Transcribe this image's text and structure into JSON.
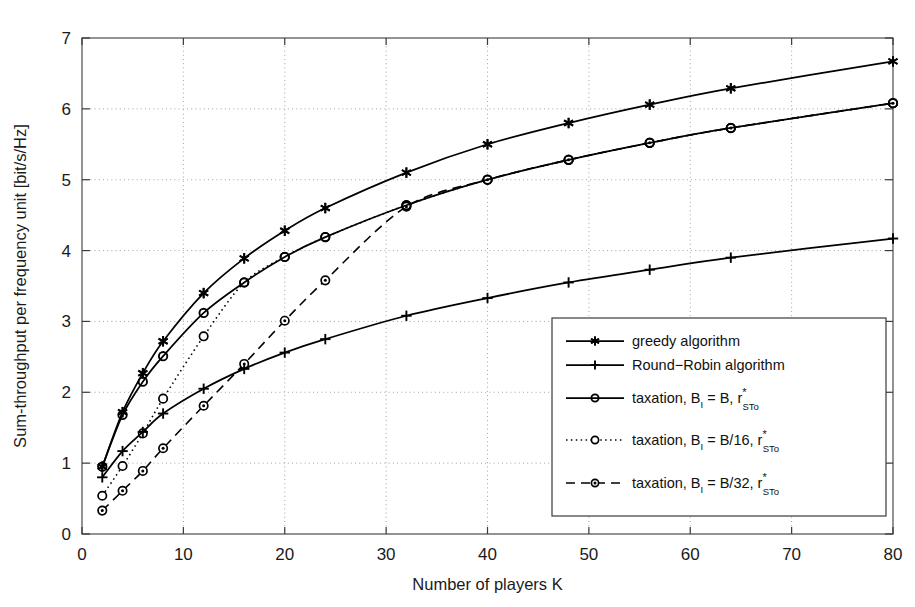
{
  "chart_data": {
    "type": "line",
    "title": "",
    "xlabel": "Number of players K",
    "ylabel": "Sum-throughput per frequency unit [bit/s/Hz]",
    "xlim": [
      0,
      80
    ],
    "ylim": [
      0,
      7
    ],
    "xticks": [
      "0",
      "10",
      "20",
      "30",
      "40",
      "50",
      "60",
      "70",
      "80"
    ],
    "yticks": [
      "0",
      "1",
      "2",
      "3",
      "4",
      "5",
      "6",
      "7"
    ],
    "grid": "dotted",
    "legend_position": "lower-right",
    "series": [
      {
        "name": "greedy algorithm",
        "marker": "asterisk",
        "linestyle": "solid",
        "color": "#000000",
        "x": [
          2,
          4,
          6,
          8,
          12,
          16,
          20,
          24,
          32,
          40,
          48,
          56,
          64,
          80
        ],
        "y": [
          0.95,
          1.72,
          2.27,
          2.72,
          3.4,
          3.89,
          4.28,
          4.6,
          5.1,
          5.5,
          5.8,
          6.06,
          6.29,
          6.67
        ]
      },
      {
        "name": "Round-Robin algorithm",
        "marker": "plus",
        "linestyle": "solid",
        "color": "#000000",
        "x": [
          2,
          4,
          6,
          8,
          12,
          16,
          20,
          24,
          32,
          40,
          48,
          56,
          64,
          80
        ],
        "y": [
          0.8,
          1.17,
          1.44,
          1.7,
          2.05,
          2.33,
          2.56,
          2.75,
          3.08,
          3.33,
          3.55,
          3.73,
          3.9,
          4.17
        ]
      },
      {
        "name": "taxation, B_I = B, r*_STo",
        "marker": "circle",
        "linestyle": "solid",
        "color": "#000000",
        "x": [
          2,
          4,
          6,
          8,
          12,
          16,
          20,
          24,
          32,
          40,
          48,
          56,
          64,
          80
        ],
        "y": [
          0.95,
          1.68,
          2.15,
          2.51,
          3.12,
          3.55,
          3.91,
          4.19,
          4.64,
          5.0,
          5.28,
          5.52,
          5.73,
          6.08
        ]
      },
      {
        "name": "taxation, B_I = B/16, r*_STo",
        "marker": "circle-open",
        "linestyle": "dotted",
        "color": "#000000",
        "x": [
          2,
          4,
          6,
          8,
          12,
          16,
          20,
          24,
          32,
          40,
          48,
          56,
          64,
          80
        ],
        "y": [
          0.54,
          0.96,
          1.42,
          1.91,
          2.79,
          3.55,
          3.91,
          4.19,
          4.64,
          5.0,
          5.28,
          5.52,
          5.73,
          6.08
        ]
      },
      {
        "name": "taxation, B_I = B/32, r*_STo",
        "marker": "circle-dot",
        "linestyle": "dashed",
        "color": "#000000",
        "x": [
          2,
          4,
          6,
          8,
          12,
          16,
          20,
          24,
          32,
          40,
          48,
          56,
          64,
          80
        ],
        "y": [
          0.33,
          0.61,
          0.89,
          1.21,
          1.81,
          2.4,
          3.01,
          3.58,
          4.62,
          5.0,
          5.28,
          5.52,
          5.73,
          6.08
        ]
      }
    ]
  },
  "legend": {
    "entries": [
      {
        "label": "greedy algorithm",
        "sub": "",
        "sup": "",
        "tail": ""
      },
      {
        "label": "Round−Robin algorithm",
        "sub": "",
        "sup": "",
        "tail": ""
      },
      {
        "label": "taxation, B",
        "sub": "I",
        "mid": " = B, r",
        "sup": "*",
        "sub2": "STo"
      },
      {
        "label": "taxation, B",
        "sub": "I",
        "mid": " = B/16, r",
        "sup": "*",
        "sub2": "STo"
      },
      {
        "label": "taxation, B",
        "sub": "I",
        "mid": " = B/32, r",
        "sup": "*",
        "sub2": "STo"
      }
    ]
  },
  "axes": {
    "x_label": "Number of players K",
    "y_label": "Sum−throughput per frequency unit [bit/s/Hz]"
  }
}
